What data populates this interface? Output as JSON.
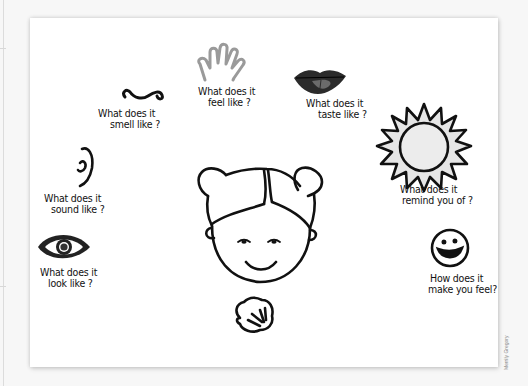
{
  "worksheet": {
    "prompts": [
      {
        "id": "smell",
        "icon": "nose-icon",
        "line1": "What does it",
        "line2": "smell like ?"
      },
      {
        "id": "feel",
        "icon": "hand-icon",
        "line1": "What does it",
        "line2": "feel like ?"
      },
      {
        "id": "taste",
        "icon": "lips-icon",
        "line1": "What does it",
        "line2": "taste like ?"
      },
      {
        "id": "sound",
        "icon": "ear-icon",
        "line1": "What does it",
        "line2": "sound like ?"
      },
      {
        "id": "remind",
        "icon": "sun-icon",
        "line1": "What does it",
        "line2": "remind you of ?"
      },
      {
        "id": "look",
        "icon": "eye-icon",
        "line1": "What does it",
        "line2": "look like ?"
      },
      {
        "id": "emotion",
        "icon": "smiley-icon",
        "line1": "How does it",
        "line2": "make you feel?"
      }
    ],
    "center_icon": "girl-face-icon",
    "bottom_icon": "seashell-icon"
  },
  "credit": "Merrily Gregory",
  "colors": {
    "ink": "#111111",
    "hand_gray": "#9a9a9a",
    "lips_dark": "#2b2b2b",
    "tongue_gray": "#6b6b6b",
    "sun_fill": "#e6e6e6",
    "card": "#ffffff",
    "background": "#f7f7f7"
  }
}
